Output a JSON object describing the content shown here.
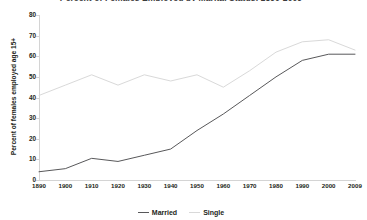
{
  "chart_data": {
    "type": "line",
    "title": "Percent of Females Employed by Marital Status, 1890-2009",
    "xlabel": "",
    "ylabel": "Percent of females employed age 15+",
    "x": [
      1890,
      1900,
      1910,
      1920,
      1930,
      1940,
      1950,
      1960,
      1970,
      1980,
      1990,
      2000,
      2009
    ],
    "xtick_labels": [
      "1890",
      "1900",
      "1910",
      "1920",
      "1930",
      "1940",
      "1950",
      "1960",
      "1970",
      "1980",
      "1990",
      "2000",
      "2009"
    ],
    "ytick_labels": [
      "0",
      "10",
      "20",
      "30",
      "40",
      "50",
      "60",
      "70",
      "80"
    ],
    "ylim": [
      0,
      80
    ],
    "ytick_step": 10,
    "grid": false,
    "legend_position": "bottom-center",
    "series": [
      {
        "name": "Married",
        "color": "#58585a",
        "values": [
          4,
          5.5,
          10.5,
          9,
          12,
          15,
          24,
          32,
          41,
          50,
          58,
          61,
          61
        ]
      },
      {
        "name": "Single",
        "color": "#d9d9d9",
        "values": [
          41,
          46,
          51,
          46,
          51,
          48,
          51,
          45,
          53,
          62,
          67,
          68,
          63
        ]
      }
    ]
  },
  "legend": {
    "items": [
      {
        "label": "Married",
        "color": "#58585a"
      },
      {
        "label": "Single",
        "color": "#d9d9d9"
      }
    ]
  },
  "axes": {
    "y_title": "Percent of females employed age 15+"
  },
  "colors": {
    "axis": "#d4d4d4",
    "text": "#231f20",
    "background": "#ffffff"
  }
}
